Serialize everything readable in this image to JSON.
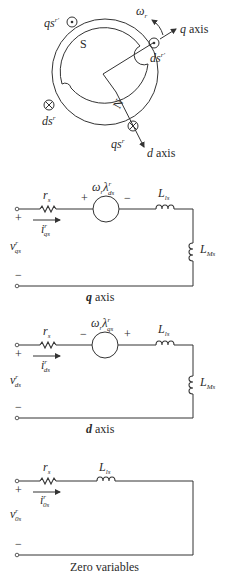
{
  "machine": {
    "rotor_pole_north": "N",
    "rotor_pole_south": "S",
    "rotor_speed_label": "ω",
    "rotor_speed_sub": "r",
    "q_axis_label": "q",
    "q_axis_word": " axis",
    "d_axis_label": "d",
    "d_axis_word": " axis",
    "windings": [
      {
        "name": "qs",
        "sup": "r′",
        "symbol": "dot"
      },
      {
        "name": "ds",
        "sup": "r′",
        "symbol": "dot"
      },
      {
        "name": "ds",
        "sup": "r",
        "symbol": "cross"
      },
      {
        "name": "qs",
        "sup": "r",
        "symbol": "cross"
      }
    ]
  },
  "circuits": {
    "q_axis": {
      "caption_var": "q",
      "caption_word": " axis",
      "resistor": {
        "main": "r",
        "sub": "s"
      },
      "source": {
        "main": "ω",
        "sub_r": "r",
        "lambda": "λ",
        "sup": "r",
        "sub": "ds",
        "left_sign": "+",
        "right_sign": "−"
      },
      "leak_inductor": {
        "main": "L",
        "sub": "ls"
      },
      "mag_inductor": {
        "main": "L",
        "sub": "Ms"
      },
      "current": {
        "main": "i",
        "sup": "r",
        "sub": "qs"
      },
      "voltage": {
        "main": "v",
        "sup": "r",
        "sub": "qs"
      },
      "plus": "+",
      "minus": "−"
    },
    "d_axis": {
      "caption_var": "d",
      "caption_word": " axis",
      "resistor": {
        "main": "r",
        "sub": "s"
      },
      "source": {
        "main": "ω",
        "sub_r": "r",
        "lambda": "λ",
        "sup": "r",
        "sub": "qs",
        "left_sign": "−",
        "right_sign": "+"
      },
      "leak_inductor": {
        "main": "L",
        "sub": "ls"
      },
      "mag_inductor": {
        "main": "L",
        "sub": "Ms"
      },
      "current": {
        "main": "i",
        "sup": "r",
        "sub": "ds"
      },
      "voltage": {
        "main": "v",
        "sup": "r",
        "sub": "ds"
      },
      "plus": "+",
      "minus": "−"
    },
    "zero": {
      "caption": "Zero variables",
      "resistor": {
        "main": "r",
        "sub": "s"
      },
      "leak_inductor": {
        "main": "L",
        "sub": "ls"
      },
      "current": {
        "main": "i",
        "sup": "r",
        "sub": "0s"
      },
      "voltage": {
        "main": "v",
        "sup": "r",
        "sub": "0s"
      },
      "plus": "+",
      "minus": "−"
    }
  }
}
